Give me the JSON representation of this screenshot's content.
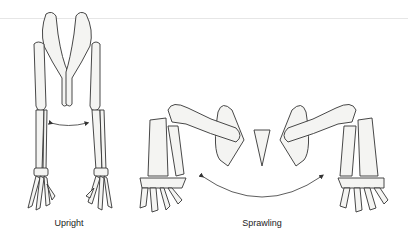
{
  "figure": {
    "panels": [
      {
        "id": "upright",
        "label": "Upright"
      },
      {
        "id": "sprawling",
        "label": "Sprawling"
      }
    ],
    "colors": {
      "bone_fill": "#f4f4f2",
      "line": "#333333",
      "background": "#ffffff"
    }
  }
}
